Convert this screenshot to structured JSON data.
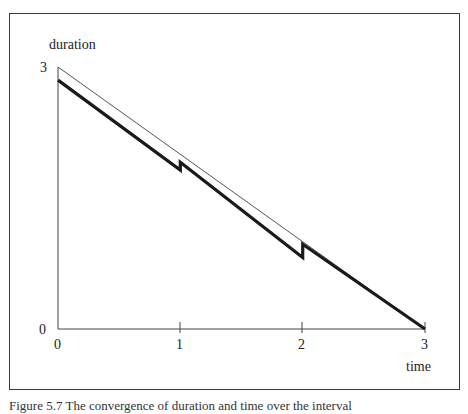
{
  "chart_data": {
    "type": "line",
    "title": "",
    "xlabel": "time",
    "ylabel": "duration",
    "xlim": [
      0,
      3
    ],
    "ylim": [
      0,
      3
    ],
    "x_ticks": [
      "0",
      "1",
      "2",
      "3"
    ],
    "y_ticks": [
      "0",
      "3"
    ],
    "grid": false,
    "legend": null,
    "series": [
      {
        "name": "ideal (thin line)",
        "style": "thin",
        "points": [
          [
            0,
            3.0
          ],
          [
            3,
            0.0
          ]
        ]
      },
      {
        "name": "actual (thick line)",
        "style": "thick",
        "points": [
          [
            0,
            2.85
          ],
          [
            1,
            1.82
          ],
          [
            1,
            1.91
          ],
          [
            2,
            0.82
          ],
          [
            2,
            0.97
          ],
          [
            3,
            0.0
          ]
        ]
      }
    ]
  },
  "labels": {
    "ylabel": "duration",
    "xlabel": "time",
    "y_top": "3",
    "y_bottom": "0",
    "x0": "0",
    "x1": "1",
    "x2": "2",
    "x3": "3"
  },
  "caption": "Figure 5.7  The convergence of duration and time over the interval"
}
